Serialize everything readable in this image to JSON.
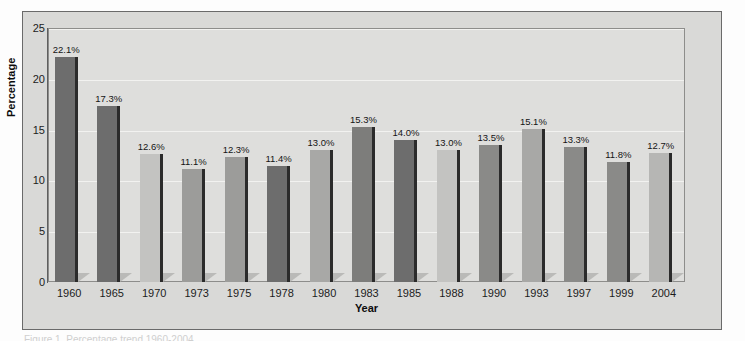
{
  "chart_data": {
    "type": "bar",
    "title": "",
    "xlabel": "Year",
    "ylabel": "Percentage",
    "ylim": [
      0,
      25
    ],
    "yticks": [
      "0",
      "5",
      "10",
      "15",
      "20",
      "25"
    ],
    "grid": true,
    "legend": "none",
    "categories": [
      "1960",
      "1965",
      "1970",
      "1973",
      "1975",
      "1978",
      "1980",
      "1983",
      "1985",
      "1988",
      "1990",
      "1993",
      "1997",
      "1999",
      "2004"
    ],
    "values": [
      22.1,
      17.3,
      12.6,
      11.1,
      12.3,
      11.4,
      13.0,
      15.3,
      14.0,
      13.0,
      13.5,
      15.1,
      13.3,
      11.8,
      12.7
    ],
    "data_labels": [
      "22.1%",
      "17.3%",
      "12.6%",
      "11.1%",
      "12.3%",
      "11.4%",
      "13.0%",
      "15.3%",
      "14.0%",
      "13.0%",
      "13.5%",
      "15.1%",
      "13.3%",
      "11.8%",
      "12.7%"
    ],
    "bar_colors": [
      "#6d6d6d",
      "#6d6d6d",
      "#c3c3c1",
      "#9c9c9a",
      "#9c9c9a",
      "#6d6d6d",
      "#a8a8a6",
      "#7d7d7b",
      "#6d6d6d",
      "#c3c3c1",
      "#8a8a88",
      "#a8a8a6",
      "#8a8a88",
      "#8a8a88",
      "#b6b6b4"
    ]
  },
  "colors": {
    "figure_background": "#fdfdfd",
    "frame_background": "#d9d9d7",
    "plot_background": "#dededc",
    "frame_border": "#6a6a6a",
    "plot_border": "#8d8d8b",
    "gridline": "#f2f2f0",
    "axis_line": "#5f5f5f",
    "text": "#1c1c1c",
    "bar_edge_dark": "#2b2b2b",
    "bar_shadow": "#b4b4b2"
  },
  "caption": {
    "text": "Figure 1. Percentage trend 1960-2004"
  }
}
